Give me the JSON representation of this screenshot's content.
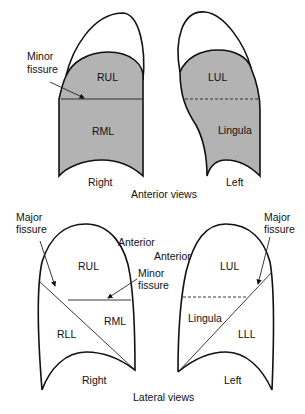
{
  "figure": {
    "colors": {
      "lobe_fill": "#b3b3b3",
      "outline": "#111111",
      "background": "#ffffff"
    },
    "anterior": {
      "caption": "Anterior views",
      "right": {
        "side_label": "Right",
        "lobes": [
          "RUL",
          "RML"
        ],
        "fissure_label_line1": "Minor",
        "fissure_label_line2": "fissure"
      },
      "left": {
        "side_label": "Left",
        "lobes": [
          "LUL",
          "Lingula"
        ]
      }
    },
    "lateral": {
      "caption": "Lateral views",
      "right": {
        "side_label": "Right",
        "lobes": [
          "RUL",
          "RML",
          "RLL"
        ],
        "major_fissure_line1": "Major",
        "major_fissure_line2": "fissure",
        "minor_fissure_line1": "Minor",
        "minor_fissure_line2": "fissure",
        "anterior_label": "Anterior"
      },
      "left": {
        "side_label": "Left",
        "lobes": [
          "LUL",
          "Lingula",
          "LLL"
        ],
        "major_fissure_line1": "Major",
        "major_fissure_line2": "fissure",
        "anterior_label": "Anterior"
      }
    }
  }
}
